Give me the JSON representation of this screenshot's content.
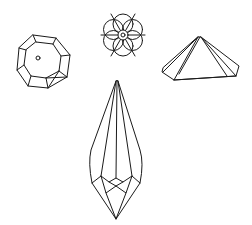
{
  "figure": {
    "background": "#ffffff",
    "stroke_color": "#1a1a1a",
    "shapes": [
      {
        "name": "octagon-crystal",
        "position": "top-left"
      },
      {
        "name": "rosette-crystal",
        "position": "top-center"
      },
      {
        "name": "pyramid-crystal",
        "position": "top-right"
      },
      {
        "name": "pendant-drop-crystal",
        "position": "bottom-center"
      }
    ]
  }
}
